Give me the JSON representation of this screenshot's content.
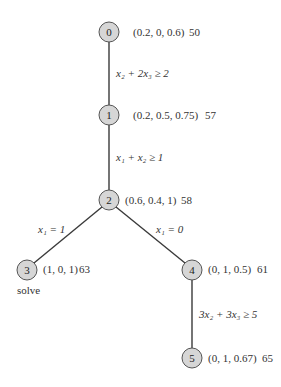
{
  "nodes": [
    {
      "id": "0",
      "solution": "(0.2, 0, 0.6)",
      "value": "50"
    },
    {
      "id": "1",
      "solution": "(0.2, 0.5, 0.75)",
      "value": "57"
    },
    {
      "id": "2",
      "solution": "(0.6, 0.4, 1)",
      "value": "58"
    },
    {
      "id": "3",
      "solution": "(1, 0, 1)",
      "value": "63",
      "note": "solve"
    },
    {
      "id": "4",
      "solution": "(0, 1, 0.5)",
      "value": "61"
    },
    {
      "id": "5",
      "solution": "(0, 1, 0.67)",
      "value": "65"
    }
  ],
  "edges": [
    {
      "from": "0",
      "to": "1",
      "label": "x₂ + 2x₃ ≥ 2"
    },
    {
      "from": "1",
      "to": "2",
      "label": "x₁ + x₂ ≥ 1"
    },
    {
      "from": "2",
      "to": "3",
      "label": "x₁ = 1"
    },
    {
      "from": "2",
      "to": "4",
      "label": "x₁ = 0"
    },
    {
      "from": "4",
      "to": "5",
      "label": "3x₂ + 3x₃ ≥ 5"
    }
  ]
}
